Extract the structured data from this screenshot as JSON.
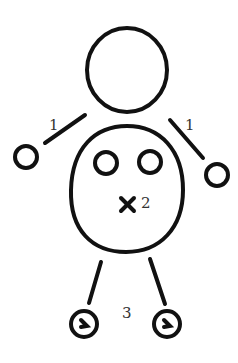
{
  "diagram": {
    "type": "hand-drawn figure",
    "stroke_color": "#111111",
    "background": "#ffffff",
    "labels": {
      "left_arm": "1",
      "right_arm": "1",
      "body_mark": "2",
      "feet": "3"
    },
    "parts": [
      "head",
      "left-arm",
      "left-hand",
      "right-arm",
      "right-hand",
      "body",
      "left-eye",
      "right-eye",
      "x-mark",
      "left-leg",
      "right-leg",
      "left-foot",
      "right-foot"
    ]
  }
}
